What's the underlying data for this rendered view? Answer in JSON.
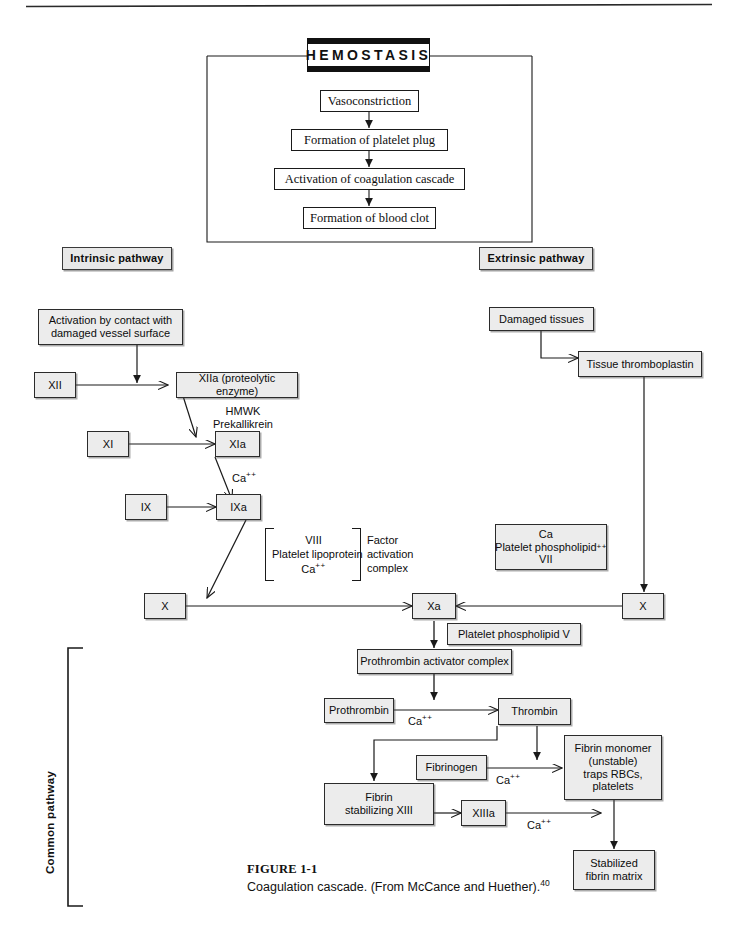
{
  "figure": {
    "number": "FIGURE 1-1",
    "caption": "Coagulation cascade. (From McCance and Huether).",
    "reference": "40"
  },
  "hemostasis": {
    "title": "HEMOSTASIS",
    "steps": [
      "Vasoconstriction",
      "Formation of platelet plug",
      "Activation of coagulation cascade",
      "Formation of blood clot"
    ]
  },
  "pathway_labels": {
    "intrinsic": "Intrinsic pathway",
    "extrinsic": "Extrinsic pathway",
    "common": "Common pathway"
  },
  "intrinsic": {
    "activation": "Activation by contact with\ndamaged vessel surface",
    "factor_xii": "XII",
    "factor_xiia": "XIIa (proteolytic enzyme)",
    "cofactors_hmwk": "HMWK\nPrekallikrein",
    "factor_xi": "XI",
    "factor_xia": "XIa",
    "ca_1": "Ca",
    "factor_ix": "IX",
    "factor_ixa": "IXa",
    "complex_contents": "VIII\nPlatelet lipoprotein\nCa",
    "complex_label": "Factor\nactivation\ncomplex",
    "factor_x_left": "X"
  },
  "extrinsic": {
    "damaged_tissues": "Damaged tissues",
    "tissue_thromboplastin": "Tissue thromboplastin",
    "cofactor_box": "Ca\nPlatelet phospholipid\nVII",
    "factor_x_right": "X"
  },
  "common": {
    "factor_xa": "Xa",
    "platelet_phospholipid_v": "Platelet phospholipid V",
    "prothrombin_activator": "Prothrombin activator complex",
    "prothrombin": "Prothrombin",
    "ca_prothrombin": "Ca",
    "thrombin": "Thrombin",
    "fibrinogen": "Fibrinogen",
    "ca_fibrinogen": "Ca",
    "fibrin_monomer": "Fibrin monomer\n(unstable)\ntraps RBCs,\nplatelets",
    "fibrin_stabilizing": "Fibrin\nstabilizing XIII",
    "factor_xiiia": "XIIIa",
    "ca_xiiia": "Ca",
    "stabilized_matrix": "Stabilized\nfibrin matrix"
  },
  "superscripts": {
    "ca_plus_plus": "++"
  },
  "colors": {
    "box_fill": "#ececec",
    "box_border": "#2b2b2b",
    "line": "#1a1a1a",
    "page_bg": "#ffffff"
  }
}
